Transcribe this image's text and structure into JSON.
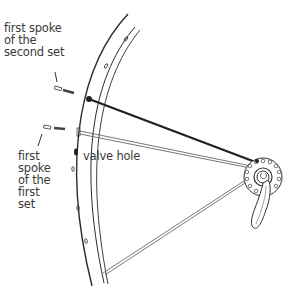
{
  "diagram": {
    "labels": {
      "second_set": "first spoke\nof the\nsecond set",
      "first_set": "first\nspoke\nof the\nfirst\nset",
      "valve_hole": "valve hole"
    },
    "colors": {
      "line": "#2a2a2a",
      "bold_spoke": "#222222",
      "thin": "#555555"
    }
  }
}
